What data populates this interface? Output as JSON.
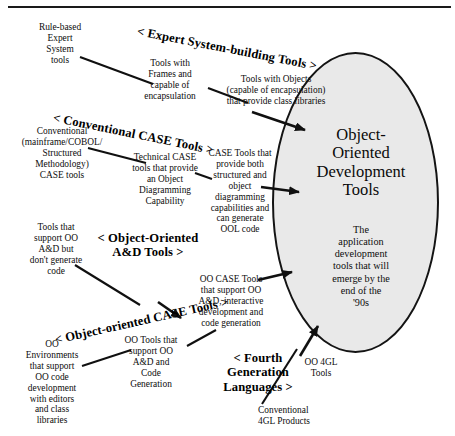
{
  "diagram": {
    "title_ellipse": "Object-\nOriented\nDevelopment\nTools",
    "ellipse_subtitle": "The\napplication\ndevelopment\ntools that will\nemerge by the\nend of the\n'90s",
    "headings": [
      {
        "id": "expert",
        "label": "< Expert System-building Tools >"
      },
      {
        "id": "conv",
        "label": "< Conventional CASE Tools >"
      },
      {
        "id": "ooad",
        "label": "< Object-Oriented\nA&D Tools >"
      },
      {
        "id": "oocase",
        "label": "< Object-oriented CASE Tools >"
      },
      {
        "id": "fourth",
        "label": "< Fourth\nGeneration\nLanguages >"
      }
    ],
    "nodes": [
      {
        "id": "rule-based-expert-system-tools",
        "label": "Rule-based\nExpert\nSystem\ntools"
      },
      {
        "id": "tools-with-frames",
        "label": "Tools with\nFrames and\ncapable of\nencapsulation"
      },
      {
        "id": "tools-with-objects",
        "label": "Tools with Objects\n(capable of encapsulation)\nthat provide class libraries"
      },
      {
        "id": "conventional-case-tools",
        "label": "Conventional\n(mainframe/COBOL/\nStructured\nMethodology)\nCASE tools"
      },
      {
        "id": "technical-case-tools",
        "label": "Technical CASE\ntools that provide\nan Object\nDiagramming\nCapability"
      },
      {
        "id": "case-tools-both",
        "label": "CASE Tools that\nprovide both\nstructured and\nobject\ndiagramming\ncapabilities and\ncan generate\nOOL code"
      },
      {
        "id": "tools-support-ooad-no-code",
        "label": "Tools that\nsupport OO\nA&D but\ndon't generate\ncode"
      },
      {
        "id": "oo-case-tools",
        "label": "OO CASE Tools\nthat support OO\nA&D, interactive\ndevelopment and\ncode generation"
      },
      {
        "id": "oo-environments",
        "label": "OO\nEnvironments\nthat support\nOO code\ndevelopment\nwith editors\nand class\nlibraries"
      },
      {
        "id": "oo-tools-support",
        "label": "OO Tools that\nsupport OO\nA&D and\nCode\nGeneration"
      },
      {
        "id": "oo-4gl-tools",
        "label": "OO 4GL\nTools"
      },
      {
        "id": "conventional-4gl-products",
        "label": "Conventional\n4GL Products"
      }
    ],
    "colors": {
      "ink": "#111111",
      "ellipse_fill": "#e9e9e9",
      "ellipse_stroke": "#141414",
      "background": "#ffffff"
    }
  }
}
